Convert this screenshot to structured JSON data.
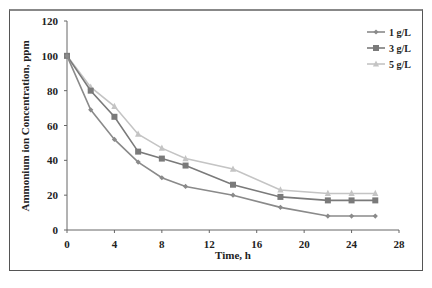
{
  "chart_data": {
    "type": "line",
    "title": "",
    "xlabel": "Time, h",
    "ylabel": "Ammonium ion Concentration, ppm",
    "xlim": [
      0,
      28
    ],
    "ylim": [
      0,
      120
    ],
    "xticks": [
      0,
      4,
      8,
      12,
      16,
      20,
      24,
      28
    ],
    "yticks": [
      0,
      20,
      40,
      60,
      80,
      100,
      120
    ],
    "grid": false,
    "legend_position": "top-right",
    "x": [
      0,
      2,
      4,
      6,
      8,
      10,
      14,
      18,
      22,
      24,
      26
    ],
    "series": [
      {
        "name": "1 g/L",
        "marker": "diamond",
        "color": "#8a8a8a",
        "values": [
          100,
          69,
          52,
          39,
          30,
          25,
          20,
          13,
          8,
          8,
          8
        ]
      },
      {
        "name": "3 g/L",
        "marker": "square",
        "color": "#7a7a7a",
        "values": [
          100,
          80,
          65,
          45,
          41,
          37,
          26,
          19,
          17,
          17,
          17
        ]
      },
      {
        "name": "5 g/L",
        "marker": "triangle",
        "color": "#c4c4c4",
        "values": [
          100,
          82,
          71,
          55,
          47,
          41,
          35,
          23,
          21,
          21,
          21
        ]
      }
    ]
  }
}
